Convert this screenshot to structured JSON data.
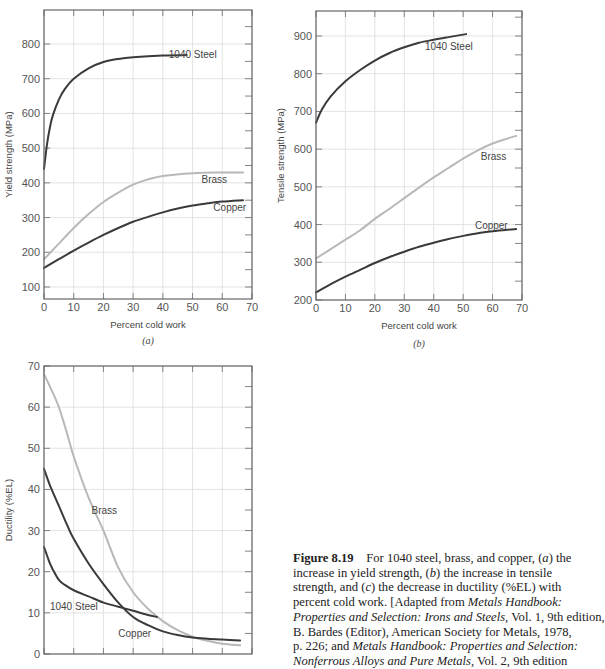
{
  "chart_data": [
    {
      "id": "a",
      "type": "line",
      "subtitle": "(a)",
      "xlabel": "Percent cold work",
      "ylabel": "Yield strength (MPa)",
      "xlim": [
        0,
        70
      ],
      "ylim": [
        65,
        880
      ],
      "xticks": [
        0,
        10,
        20,
        30,
        40,
        50,
        60,
        70
      ],
      "yticks": [
        100,
        200,
        300,
        400,
        500,
        600,
        700,
        800
      ],
      "grid": true,
      "series": [
        {
          "name": "1040 Steel",
          "color": "#3a3a3a",
          "x": [
            0,
            1,
            2,
            3,
            5,
            7,
            10,
            15,
            20,
            25,
            30,
            40,
            48
          ],
          "y": [
            440,
            510,
            560,
            595,
            640,
            670,
            700,
            730,
            748,
            757,
            762,
            767,
            768
          ],
          "label_pos": [
            42,
            760
          ]
        },
        {
          "name": "Brass",
          "color": "#b8b8b8",
          "x": [
            0,
            5,
            10,
            15,
            20,
            25,
            30,
            35,
            40,
            50,
            60,
            67
          ],
          "y": [
            180,
            225,
            270,
            310,
            345,
            372,
            395,
            410,
            420,
            428,
            430,
            430
          ],
          "label_pos": [
            53,
            400
          ]
        },
        {
          "name": "Copper",
          "color": "#3a3a3a",
          "x": [
            0,
            5,
            10,
            15,
            20,
            25,
            30,
            35,
            40,
            45,
            50,
            55,
            60,
            67
          ],
          "y": [
            155,
            180,
            205,
            228,
            250,
            270,
            288,
            302,
            315,
            326,
            335,
            341,
            346,
            350
          ],
          "label_pos": [
            57,
            318
          ]
        }
      ]
    },
    {
      "id": "b",
      "type": "line",
      "subtitle": "(b)",
      "xlabel": "Percent cold work",
      "ylabel": "Tensile strength (MPa)",
      "xlim": [
        0,
        70
      ],
      "ylim": [
        200,
        965
      ],
      "xticks": [
        0,
        10,
        20,
        30,
        40,
        50,
        60,
        70
      ],
      "yticks": [
        200,
        300,
        400,
        500,
        600,
        700,
        800,
        900
      ],
      "grid": true,
      "series": [
        {
          "name": "1040 Steel",
          "color": "#3a3a3a",
          "x": [
            0,
            2,
            5,
            10,
            15,
            20,
            25,
            30,
            35,
            40,
            45,
            51
          ],
          "y": [
            670,
            705,
            740,
            780,
            810,
            835,
            855,
            870,
            882,
            890,
            897,
            905
          ],
          "label_pos": [
            37,
            862
          ]
        },
        {
          "name": "Brass",
          "color": "#b8b8b8",
          "x": [
            0,
            5,
            10,
            15,
            20,
            25,
            30,
            35,
            40,
            45,
            50,
            55,
            60,
            65,
            68
          ],
          "y": [
            310,
            335,
            360,
            385,
            415,
            442,
            470,
            498,
            525,
            550,
            575,
            597,
            615,
            628,
            635
          ],
          "label_pos": [
            56,
            570
          ]
        },
        {
          "name": "Copper",
          "color": "#3a3a3a",
          "x": [
            0,
            5,
            10,
            15,
            20,
            25,
            30,
            35,
            40,
            45,
            50,
            55,
            60,
            65,
            68
          ],
          "y": [
            220,
            242,
            262,
            280,
            298,
            314,
            328,
            341,
            352,
            362,
            370,
            377,
            382,
            386,
            388
          ],
          "label_pos": [
            54,
            388
          ]
        }
      ]
    },
    {
      "id": "c",
      "type": "line",
      "subtitle": "",
      "xlabel": "",
      "ylabel": "Ductility (%EL)",
      "xlim": [
        0,
        70
      ],
      "ylim": [
        0,
        70
      ],
      "xticks": [
        0,
        10,
        20,
        30,
        40,
        50,
        60,
        70
      ],
      "yticks": [
        0,
        10,
        20,
        30,
        40,
        50,
        60,
        70
      ],
      "grid": true,
      "series": [
        {
          "name": "Brass",
          "color": "#b8b8b8",
          "x": [
            0,
            2,
            5,
            8,
            10,
            15,
            20,
            25,
            30,
            35,
            40,
            45,
            50,
            55,
            60,
            66
          ],
          "y": [
            68,
            65,
            60,
            53,
            48,
            38,
            30,
            21,
            15,
            11,
            8,
            5.8,
            4.2,
            3.2,
            2.5,
            2.1
          ],
          "label_pos": [
            16,
            34
          ]
        },
        {
          "name": "Copper",
          "color": "#3a3a3a",
          "x": [
            0,
            2,
            5,
            8,
            10,
            15,
            20,
            25,
            30,
            35,
            40,
            45,
            50,
            55,
            60,
            66
          ],
          "y": [
            45,
            41,
            36,
            31,
            28,
            22,
            17,
            12.5,
            9,
            7,
            5.5,
            4.6,
            4.0,
            3.7,
            3.5,
            3.3
          ],
          "label_pos": [
            25,
            4.2
          ]
        },
        {
          "name": "1040 Steel",
          "color": "#3a3a3a",
          "x": [
            0,
            1,
            2,
            3,
            5,
            7,
            10,
            15,
            20,
            25,
            30,
            35,
            38
          ],
          "y": [
            26,
            24,
            22,
            20.5,
            18,
            16.8,
            15.5,
            14,
            12.5,
            11.5,
            10.5,
            9.5,
            9
          ],
          "label_pos": [
            2,
            10.8
          ]
        }
      ]
    }
  ],
  "caption": {
    "figure_label": "Figure 8.19",
    "lines": [
      [
        "For 1040 steel, brass, and copper, (",
        "a",
        ") the"
      ],
      [
        "increase in yield strength, (",
        "b",
        ") the increase in tensile"
      ],
      [
        "strength, and (",
        "c",
        ") the decrease in ductility (%EL) with"
      ],
      [
        "percent cold work. [Adapted from ",
        "Metals Handbook:",
        ""
      ],
      [
        "",
        "Properties and Selection: Irons and Steels,",
        " Vol. 1, 9th edition,"
      ],
      [
        "B. Bardes (Editor), American Society for Metals, 1978,",
        "",
        ""
      ],
      [
        "p. 226; and ",
        "Metals Handbook: Properties and Selection:",
        ""
      ],
      [
        "",
        "Nonferrous Alloys and Pure Metals,",
        " Vol. 2, 9th edition"
      ]
    ]
  }
}
